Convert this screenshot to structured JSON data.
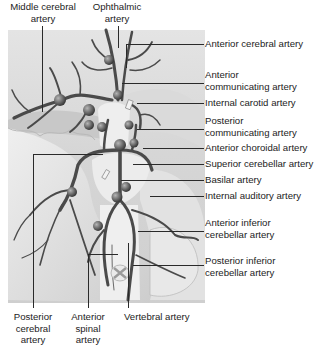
{
  "diagram": {
    "labels_top": [
      {
        "id": "middle-cerebral-artery",
        "text_lines": [
          "Middle cerebral",
          "artery"
        ]
      },
      {
        "id": "ophthalmic-artery",
        "text_lines": [
          "Ophthalmic",
          "artery"
        ]
      }
    ],
    "labels_right": [
      {
        "id": "anterior-cerebral-artery",
        "text_lines": [
          "Anterior cerebral artery"
        ]
      },
      {
        "id": "anterior-communicating-artery",
        "text_lines": [
          "Anterior",
          "communicating artery"
        ]
      },
      {
        "id": "internal-carotid-artery",
        "text_lines": [
          "Internal carotid artery"
        ]
      },
      {
        "id": "posterior-communicating-artery",
        "text_lines": [
          "Posterior",
          "communicating artery"
        ]
      },
      {
        "id": "anterior-choroidal-artery",
        "text_lines": [
          "Anterior choroidal artery"
        ]
      },
      {
        "id": "superior-cerebellar-artery",
        "text_lines": [
          "Superior cerebellar artery"
        ]
      },
      {
        "id": "basilar-artery",
        "text_lines": [
          "Basilar artery"
        ]
      },
      {
        "id": "internal-auditory-artery",
        "text_lines": [
          "Internal auditory artery"
        ]
      },
      {
        "id": "anterior-inferior-cerebellar-artery",
        "text_lines": [
          "Anterior inferior",
          "cerebellar artery"
        ]
      },
      {
        "id": "posterior-inferior-cerebellar-artery",
        "text_lines": [
          "Posterior inferior",
          "cerebellar artery"
        ]
      }
    ],
    "labels_bottom": [
      {
        "id": "posterior-cerebral-artery",
        "text_lines": [
          "Posterior",
          "cerebral",
          "artery"
        ]
      },
      {
        "id": "anterior-spinal-artery",
        "text_lines": [
          "Anterior",
          "spinal",
          "artery"
        ]
      },
      {
        "id": "vertebral-artery",
        "text_lines": [
          "Vertebral artery"
        ]
      }
    ],
    "colors": {
      "artery": "#4a4a4a",
      "background_tissue": "#d8d8d8",
      "leader_line": "#2a2a2a",
      "text": "#1c1c1c"
    }
  }
}
